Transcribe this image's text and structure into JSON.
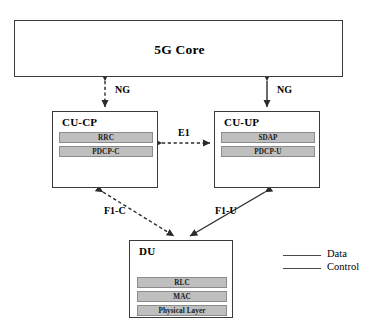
{
  "diagram": {
    "nodes": {
      "core": {
        "label": "5G Core"
      },
      "cu_cp": {
        "label": "CU-CP",
        "layers": [
          {
            "name": "RRC"
          },
          {
            "name": "PDCP-C"
          }
        ]
      },
      "cu_up": {
        "label": "CU-UP",
        "layers": [
          {
            "name": "SDAP"
          },
          {
            "name": "PDCP-U"
          }
        ]
      },
      "du": {
        "label": "DU",
        "layers": [
          {
            "name": "RLC"
          },
          {
            "name": "MAC"
          },
          {
            "name": "Physical Layer"
          }
        ]
      }
    },
    "edges": {
      "ng_control": {
        "label": "NG",
        "style": "dashed"
      },
      "ng_data": {
        "label": "NG",
        "style": "solid"
      },
      "e1": {
        "label": "E1",
        "style": "dashed"
      },
      "f1_c": {
        "label": "F1-C",
        "style": "dashed"
      },
      "f1_u": {
        "label": "F1-U",
        "style": "solid"
      }
    },
    "legend": {
      "items": [
        {
          "label": "Data",
          "style": "solid"
        },
        {
          "label": "Control",
          "style": "solid"
        }
      ]
    },
    "colors": {
      "stroke": "#3a3a3a",
      "bar_fill": "#bfbfbf",
      "bar_stroke": "#8c8c8c",
      "background": "#ffffff"
    }
  }
}
